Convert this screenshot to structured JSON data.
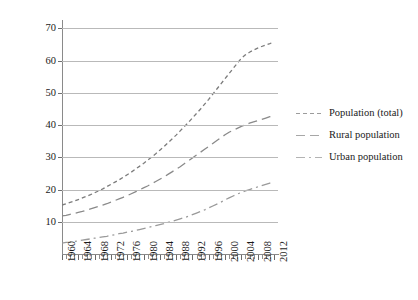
{
  "chart_data": {
    "type": "line",
    "title": "",
    "xlabel": "",
    "ylabel": "Population (million)",
    "xlim": [
      1960,
      2013
    ],
    "ylim": [
      0,
      72
    ],
    "ytick_values": [
      10,
      20,
      30,
      40,
      50,
      60,
      70
    ],
    "ytick_labels": [
      "10",
      "20",
      "30",
      "40",
      "50",
      "60",
      "70"
    ],
    "xtick_labels": [
      "1960",
      "1964",
      "1968",
      "1972",
      "1976",
      "1980",
      "1984",
      "1988",
      "1992",
      "1996",
      "2000",
      "2004",
      "2008",
      "2012"
    ],
    "xtick_values": [
      1960,
      1964,
      1968,
      1972,
      1976,
      1980,
      1984,
      1988,
      1992,
      1996,
      2000,
      2004,
      2008,
      2012
    ],
    "minor_xtick_step": 1,
    "grid": "horizontal",
    "legend_position": "right",
    "x": [
      1960,
      1961,
      1962,
      1963,
      1964,
      1965,
      1966,
      1967,
      1968,
      1969,
      1970,
      1971,
      1972,
      1973,
      1974,
      1975,
      1976,
      1977,
      1978,
      1979,
      1980,
      1981,
      1982,
      1983,
      1984,
      1985,
      1986,
      1987,
      1988,
      1989,
      1990,
      1991,
      1992,
      1993,
      1994,
      1995,
      1996,
      1997,
      1998,
      1999,
      2000,
      2001,
      2002,
      2003,
      2004,
      2005,
      2006,
      2007,
      2008,
      2009,
      2010,
      2011,
      2012
    ],
    "series": [
      {
        "name": "Population (total)",
        "linestyle": "dashed",
        "color": "#7c7c7c",
        "values": [
          15.2,
          15.6,
          16.0,
          16.4,
          16.9,
          17.4,
          17.9,
          18.4,
          19.0,
          19.6,
          20.2,
          20.9,
          21.6,
          22.3,
          23.0,
          23.8,
          24.6,
          25.4,
          26.3,
          27.2,
          28.1,
          29.1,
          30.1,
          31.1,
          32.2,
          33.3,
          34.5,
          35.7,
          36.9,
          38.2,
          39.5,
          40.8,
          42.2,
          43.6,
          45.0,
          46.5,
          48.0,
          49.6,
          51.2,
          52.8,
          54.4,
          56.0,
          57.6,
          59.2,
          60.7,
          61.8,
          62.6,
          63.3,
          63.9,
          64.4,
          64.9,
          65.3,
          65.8
        ]
      },
      {
        "name": "Rural population",
        "linestyle": "long-dashed",
        "color": "#8a8a8a",
        "values": [
          11.8,
          12.0,
          12.3,
          12.6,
          12.9,
          13.2,
          13.6,
          14.0,
          14.4,
          14.8,
          15.2,
          15.6,
          16.1,
          16.6,
          17.1,
          17.6,
          18.1,
          18.7,
          19.3,
          19.9,
          20.5,
          21.1,
          21.8,
          22.5,
          23.2,
          23.9,
          24.7,
          25.5,
          26.3,
          27.1,
          28.0,
          28.9,
          29.8,
          30.7,
          31.6,
          32.5,
          33.4,
          34.3,
          35.2,
          36.1,
          37.0,
          37.8,
          38.4,
          39.0,
          39.6,
          40.1,
          40.6,
          41.0,
          41.4,
          41.8,
          42.2,
          42.6,
          43.0
        ]
      },
      {
        "name": "Urban population",
        "linestyle": "dash-dot",
        "color": "#9a9a9a",
        "values": [
          3.4,
          3.6,
          3.7,
          3.9,
          4.1,
          4.3,
          4.5,
          4.7,
          4.9,
          5.1,
          5.3,
          5.5,
          5.8,
          6.0,
          6.3,
          6.5,
          6.8,
          7.0,
          7.3,
          7.6,
          7.9,
          8.2,
          8.5,
          8.8,
          9.1,
          9.4,
          9.8,
          10.1,
          10.5,
          10.9,
          11.3,
          11.7,
          12.2,
          12.7,
          13.2,
          13.7,
          14.3,
          14.9,
          15.5,
          16.1,
          16.8,
          17.4,
          18.0,
          18.6,
          19.1,
          19.6,
          20.0,
          20.4,
          20.8,
          21.2,
          21.6,
          22.0,
          22.4
        ]
      }
    ]
  },
  "legend": {
    "items": [
      {
        "label": "Population (total)"
      },
      {
        "label": "Rural population"
      },
      {
        "label": "Urban population"
      }
    ]
  }
}
